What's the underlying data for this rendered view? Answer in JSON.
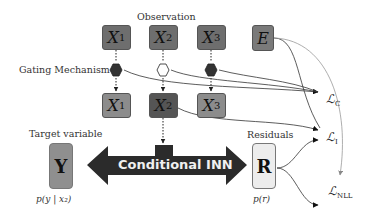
{
  "labels": {
    "observation": "Observation",
    "gating": "Gating Mechanism",
    "target": "Target variable",
    "residuals": "Residuals"
  },
  "observation_nodes": [
    {
      "name": "X",
      "sub": "1",
      "color": "#6e6e6e"
    },
    {
      "name": "X",
      "sub": "2",
      "color": "#6e6e6e"
    },
    {
      "name": "X",
      "sub": "3",
      "color": "#6e6e6e"
    }
  ],
  "extra_node": {
    "name": "E",
    "color": "#7a7a7a"
  },
  "gates": [
    {
      "state": "closed",
      "color": "#333333"
    },
    {
      "state": "open",
      "color": "#ffffff"
    },
    {
      "state": "closed",
      "color": "#333333"
    }
  ],
  "gated_nodes": [
    {
      "name": "X",
      "sub": "1",
      "color": "#8c8c8c"
    },
    {
      "name": "X",
      "sub": "2",
      "color": "#555555"
    },
    {
      "name": "X",
      "sub": "3",
      "color": "#8c8c8c"
    }
  ],
  "target": {
    "symbol": "Y",
    "prob": "p(y | x₂)",
    "color": "#8f8f8f"
  },
  "residual": {
    "symbol": "R",
    "prob": "p(r)",
    "color": "#ededed"
  },
  "inn": {
    "label": "Conditional INN",
    "color": "#2b2b2b"
  },
  "losses": [
    {
      "symbol": "ℒ",
      "sub": "C"
    },
    {
      "symbol": "ℒ",
      "sub": "I"
    },
    {
      "symbol": "ℒ",
      "sub": "NLL"
    }
  ]
}
